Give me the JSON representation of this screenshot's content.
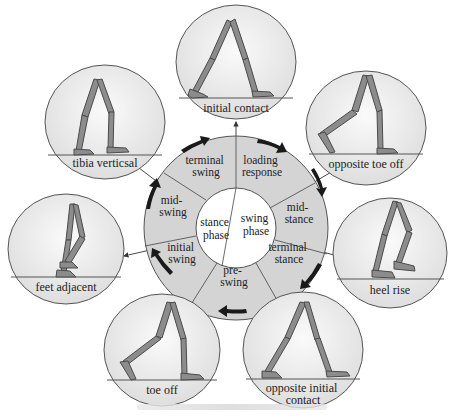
{
  "diagram": {
    "type": "gait-cycle",
    "center_labels": [
      {
        "id": "stance",
        "lines": [
          "stance",
          "phase"
        ]
      },
      {
        "id": "swing",
        "lines": [
          "swing",
          "phase"
        ]
      }
    ],
    "ring_segments": [
      {
        "id": "loading-response",
        "lines": [
          "loading",
          "response"
        ]
      },
      {
        "id": "mid-stance",
        "lines": [
          "mid-",
          "stance"
        ]
      },
      {
        "id": "terminal-stance",
        "lines": [
          "terminal",
          "stance"
        ]
      },
      {
        "id": "pre-swing",
        "lines": [
          "pre-",
          "swing"
        ]
      },
      {
        "id": "initial-swing",
        "lines": [
          "initial",
          "swing"
        ]
      },
      {
        "id": "mid-swing",
        "lines": [
          "mid-",
          "swing"
        ]
      },
      {
        "id": "terminal-swing",
        "lines": [
          "terminal",
          "swing"
        ]
      }
    ],
    "events": [
      {
        "id": "initial-contact",
        "lines": [
          "initial contact"
        ]
      },
      {
        "id": "opposite-toe-off",
        "lines": [
          "opposite toe off"
        ]
      },
      {
        "id": "heel-rise",
        "lines": [
          "heel rise"
        ]
      },
      {
        "id": "opposite-initial-contact",
        "lines": [
          "opposite initial",
          "contact"
        ]
      },
      {
        "id": "toe-off",
        "lines": [
          "toe off"
        ]
      },
      {
        "id": "feet-adjacent",
        "lines": [
          "feet adjacent"
        ]
      },
      {
        "id": "tibia-vertical",
        "lines": [
          "tibia verticsal"
        ]
      }
    ],
    "colors": {
      "ring_fill": "#d4d4d4",
      "ring_stroke": "#555555",
      "arrow_fill": "#1a1a1a",
      "leg_fill": "#8c8c8c",
      "leg_stroke": "#4a4a4a",
      "bubble_fill": "#ececec"
    },
    "caption": ""
  }
}
